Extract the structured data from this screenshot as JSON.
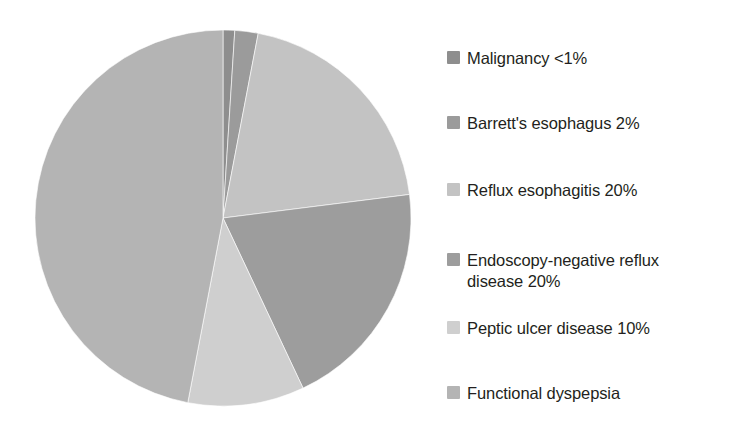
{
  "chart_data": {
    "type": "pie",
    "title": "",
    "subtitle": "",
    "xlabel": "",
    "ylabel": "",
    "legend_position": "right",
    "grid": false,
    "start_angle_deg": 0,
    "direction": "clockwise",
    "categories": [
      "Malignancy <1%",
      "Barrett's esophagus 2%",
      "Reflux esophagitis 20%",
      "Endoscopy-negative reflux disease 20%",
      "Peptic ulcer disease 10%",
      "Functional dyspepsia"
    ],
    "values": [
      1,
      2,
      20,
      20,
      10,
      47
    ],
    "value_labels": [
      "<1%",
      "2%",
      "20%",
      "20%",
      "10%",
      ""
    ],
    "colors": [
      "#8e8e8e",
      "#9b9b9b",
      "#c3c3c3",
      "#9d9d9d",
      "#cfcfcf",
      "#b4b4b4"
    ],
    "slices": [
      {
        "label": "Malignancy <1%",
        "value": 1,
        "display_value": "<1%",
        "color": "#8e8e8e",
        "start_deg": 0,
        "end_deg": 3.6
      },
      {
        "label": "Barrett's esophagus 2%",
        "value": 2,
        "display_value": "2%",
        "color": "#9b9b9b",
        "start_deg": 3.6,
        "end_deg": 10.8
      },
      {
        "label": "Reflux esophagitis 20%",
        "value": 20,
        "display_value": "20%",
        "color": "#c3c3c3",
        "start_deg": 10.8,
        "end_deg": 82.8
      },
      {
        "label": "Endoscopy-negative reflux disease 20%",
        "value": 20,
        "display_value": "20%",
        "color": "#9d9d9d",
        "start_deg": 82.8,
        "end_deg": 154.8
      },
      {
        "label": "Peptic ulcer disease 10%",
        "value": 10,
        "display_value": "10%",
        "color": "#cfcfcf",
        "start_deg": 154.8,
        "end_deg": 190.8
      },
      {
        "label": "Functional dyspepsia",
        "value": 47,
        "display_value": "",
        "color": "#b4b4b4",
        "start_deg": 190.8,
        "end_deg": 360
      }
    ]
  },
  "legend": {
    "items": [
      {
        "label": "Malignancy <1%",
        "color": "#8e8e8e",
        "top": 20
      },
      {
        "label": "Barrett's esophagus 2%",
        "color": "#9b9b9b",
        "top": 85
      },
      {
        "label": "Reflux esophagitis 20%",
        "color": "#c3c3c3",
        "top": 152
      },
      {
        "label": "Endoscopy-negative reflux\ndisease 20%",
        "color": "#9d9d9d",
        "top": 222
      },
      {
        "label": "Peptic ulcer disease 10%",
        "color": "#cfcfcf",
        "top": 290
      },
      {
        "label": "Functional dyspepsia",
        "color": "#b4b4b4",
        "top": 355
      }
    ]
  }
}
